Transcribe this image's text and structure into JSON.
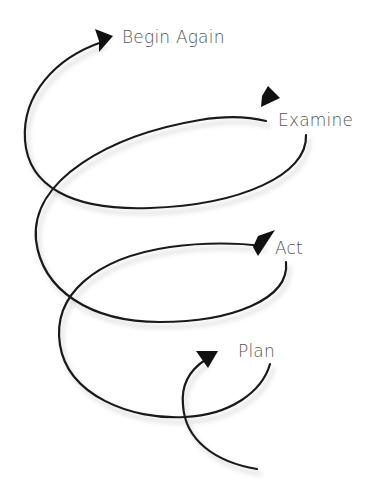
{
  "diagram": {
    "type": "spiral-cycle",
    "stages": [
      {
        "id": "plan",
        "label": "Plan",
        "order": 1
      },
      {
        "id": "act",
        "label": "Act",
        "order": 2
      },
      {
        "id": "examine",
        "label": "Examine",
        "order": 3
      },
      {
        "id": "begin-again",
        "label": "Begin Again",
        "order": 4
      }
    ],
    "flow": [
      {
        "from": "start",
        "to": "plan"
      },
      {
        "from": "plan",
        "to": "act"
      },
      {
        "from": "act",
        "to": "examine"
      },
      {
        "from": "examine",
        "to": "begin-again"
      }
    ],
    "colors": {
      "line": "#1a1a1a",
      "label": "#555555",
      "background": "#ffffff"
    }
  }
}
